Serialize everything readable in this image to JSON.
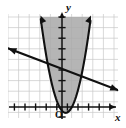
{
  "figure": {
    "width": 126,
    "height": 128,
    "background_color": "#ffffff",
    "plot_area": {
      "left": 8,
      "top": 14,
      "right": 118,
      "bottom": 118
    },
    "grid": {
      "visible": true,
      "color": "#c9c9c9",
      "spacing_px": 10.6,
      "minor_color": "#dedede"
    },
    "origin_px": {
      "x": 62,
      "y": 107
    },
    "unit_px": 10.6
  },
  "chart_data": {
    "type": "line",
    "title": "",
    "subtitle": "",
    "xlabel": "x",
    "ylabel": "y",
    "origin_label": "O",
    "xlim": [
      -5,
      5
    ],
    "ylim": [
      -1,
      9
    ],
    "grid": true,
    "legend": "none",
    "axes": {
      "x_axis_label": "x",
      "y_axis_label": "y",
      "x_tick_count": 10,
      "y_tick_count": 9,
      "tick_length_px": 5,
      "arrowheads": [
        "x-positive",
        "y-positive"
      ],
      "axis_color": "#111111"
    },
    "series": [
      {
        "name": "parabola",
        "kind": "parabola",
        "label": "",
        "color": "#111111",
        "line_width": 2.1,
        "opens": "up",
        "vertex": [
          0.35,
          -0.55
        ],
        "a": 1.6,
        "equation": "y = 1.6(x - 0.35)^2 - 0.55",
        "arrowheads": [
          "upper-left",
          "upper-right"
        ],
        "points": [
          [
            -1.85,
            7.9
          ],
          [
            -1.5,
            5.2
          ],
          [
            -1.0,
            2.4
          ],
          [
            -0.5,
            0.66
          ],
          [
            0.0,
            -0.35
          ],
          [
            0.35,
            -0.55
          ],
          [
            0.8,
            -0.23
          ],
          [
            1.3,
            0.93
          ],
          [
            1.8,
            2.8
          ],
          [
            2.3,
            5.6
          ],
          [
            2.6,
            7.9
          ]
        ]
      },
      {
        "name": "line",
        "kind": "line",
        "label": "",
        "color": "#111111",
        "line_width": 2.1,
        "slope": -0.38,
        "intercept": 3.6,
        "equation": "y = -0.38x + 3.6",
        "arrowheads": [
          "left",
          "right"
        ],
        "points": [
          [
            -5.1,
            5.5
          ],
          [
            0.0,
            3.6
          ],
          [
            5.3,
            1.6
          ]
        ]
      }
    ],
    "shaded_regions": [
      {
        "name": "parabola-interior",
        "description": "region inside and above the parabola",
        "fill_color": "#a8a8a8",
        "opacity": 0.85,
        "boundary": "parabola",
        "side": "inside"
      }
    ]
  }
}
